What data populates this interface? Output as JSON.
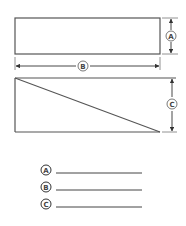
{
  "diagram": {
    "rectangle": {
      "x": 15,
      "y": 18,
      "width": 145,
      "height": 36
    },
    "triangle": {
      "x": 15,
      "y": 78,
      "width": 145,
      "height": 54
    },
    "dimensions": {
      "A": {
        "label": "A",
        "target": "rectangle-height"
      },
      "B": {
        "label": "B",
        "target": "rectangle-width"
      },
      "C": {
        "label": "C",
        "target": "triangle-height"
      }
    },
    "colors": {
      "stroke": "#555555",
      "background": "#ffffff"
    }
  },
  "answer_key": [
    {
      "label": "A",
      "value": ""
    },
    {
      "label": "B",
      "value": ""
    },
    {
      "label": "C",
      "value": ""
    }
  ]
}
